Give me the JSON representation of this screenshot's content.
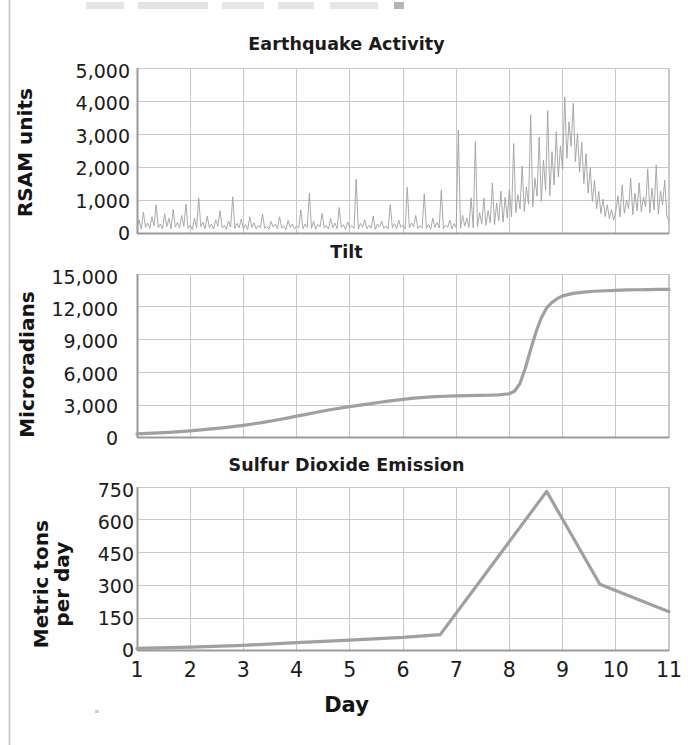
{
  "figure": {
    "x_axis_title": "Day",
    "x_ticks": [
      "1",
      "2",
      "3",
      "4",
      "5",
      "6",
      "7",
      "8",
      "9",
      "10",
      "11"
    ],
    "line_color": "#a0a0a0",
    "grid_color": "#c9c9c9",
    "axis_color": "#9a9a9a",
    "background": "#fefefe",
    "text_color": "#1b1b1b"
  },
  "charts": [
    {
      "id": "earthquake-activity",
      "title": "Earthquake Activity",
      "ylabel": "RSAM units",
      "ylabel_lines": "RSAM units",
      "yticks": [
        "5,000",
        "4,000",
        "3,000",
        "2,000",
        "1,000",
        "0"
      ],
      "ytick_values": [
        5000,
        4000,
        3000,
        2000,
        1000,
        0
      ]
    },
    {
      "id": "tilt",
      "title": "Tilt",
      "ylabel": "Microradians",
      "ylabel_lines": "Microradians",
      "yticks": [
        "15,000",
        "12,000",
        "9,000",
        "6,000",
        "3,000",
        "0"
      ],
      "ytick_values": [
        15000,
        12000,
        9000,
        6000,
        3000,
        0
      ]
    },
    {
      "id": "sulfur-dioxide-emission",
      "title": "Sulfur Dioxide Emission",
      "ylabel": "Metric tons per day",
      "ylabel_lines": "Metric tons\nper day",
      "yticks": [
        "750",
        "600",
        "450",
        "300",
        "150",
        "0"
      ],
      "ytick_values": [
        750,
        600,
        450,
        300,
        150,
        0
      ]
    }
  ],
  "chart_data": [
    {
      "type": "line",
      "id": "earthquake-activity",
      "title": "Earthquake Activity",
      "xlabel": "Day",
      "ylabel": "RSAM units",
      "xlim": [
        1,
        11
      ],
      "ylim": [
        0,
        5000
      ],
      "yticks": [
        0,
        1000,
        2000,
        3000,
        4000,
        5000
      ],
      "xticks": [
        1,
        2,
        3,
        4,
        5,
        6,
        7,
        8,
        9,
        10,
        11
      ],
      "grid": true,
      "legend": "none",
      "description": "Dense high-frequency seismic tremor trace. Background noise 100-900 RSAM with frequent spikes to 1,000-1,500 through days 1-7, escalating swarm days 7.5-9.5 with peaks to 3,000-4,100, then decay back to 300-2,000 noise through day 11.",
      "x": [
        1.0,
        1.04,
        1.08,
        1.12,
        1.16,
        1.2,
        1.24,
        1.28,
        1.32,
        1.36,
        1.4,
        1.44,
        1.48,
        1.52,
        1.56,
        1.6,
        1.64,
        1.68,
        1.72,
        1.76,
        1.8,
        1.84,
        1.88,
        1.92,
        1.96,
        2.0,
        2.04,
        2.08,
        2.12,
        2.16,
        2.2,
        2.24,
        2.28,
        2.32,
        2.36,
        2.4,
        2.44,
        2.48,
        2.52,
        2.56,
        2.6,
        2.64,
        2.68,
        2.72,
        2.76,
        2.8,
        2.84,
        2.88,
        2.92,
        2.96,
        3.0,
        3.04,
        3.08,
        3.12,
        3.16,
        3.2,
        3.24,
        3.28,
        3.32,
        3.36,
        3.4,
        3.44,
        3.48,
        3.52,
        3.56,
        3.6,
        3.64,
        3.68,
        3.72,
        3.76,
        3.8,
        3.84,
        3.88,
        3.92,
        3.96,
        4.0,
        4.04,
        4.08,
        4.12,
        4.16,
        4.2,
        4.24,
        4.28,
        4.32,
        4.36,
        4.4,
        4.44,
        4.48,
        4.52,
        4.56,
        4.6,
        4.64,
        4.68,
        4.72,
        4.76,
        4.8,
        4.84,
        4.88,
        4.92,
        4.96,
        5.0,
        5.04,
        5.08,
        5.12,
        5.16,
        5.2,
        5.24,
        5.28,
        5.32,
        5.36,
        5.4,
        5.44,
        5.48,
        5.52,
        5.56,
        5.6,
        5.64,
        5.68,
        5.72,
        5.76,
        5.8,
        5.84,
        5.88,
        5.92,
        5.96,
        6.0,
        6.04,
        6.08,
        6.12,
        6.16,
        6.2,
        6.24,
        6.28,
        6.32,
        6.36,
        6.4,
        6.44,
        6.48,
        6.52,
        6.56,
        6.6,
        6.64,
        6.68,
        6.72,
        6.76,
        6.8,
        6.84,
        6.88,
        6.92,
        6.96,
        7.0,
        7.04,
        7.08,
        7.12,
        7.16,
        7.2,
        7.24,
        7.28,
        7.32,
        7.36,
        7.4,
        7.44,
        7.48,
        7.52,
        7.56,
        7.6,
        7.64,
        7.68,
        7.72,
        7.76,
        7.8,
        7.84,
        7.88,
        7.92,
        7.96,
        8.0,
        8.04,
        8.08,
        8.12,
        8.16,
        8.2,
        8.24,
        8.28,
        8.32,
        8.36,
        8.4,
        8.44,
        8.48,
        8.52,
        8.56,
        8.6,
        8.64,
        8.68,
        8.72,
        8.76,
        8.8,
        8.84,
        8.88,
        8.92,
        8.96,
        9.0,
        9.04,
        9.08,
        9.12,
        9.16,
        9.2,
        9.24,
        9.28,
        9.32,
        9.36,
        9.4,
        9.44,
        9.48,
        9.52,
        9.56,
        9.6,
        9.64,
        9.68,
        9.72,
        9.76,
        9.8,
        9.84,
        9.88,
        9.92,
        9.96,
        10.0,
        10.04,
        10.08,
        10.12,
        10.16,
        10.2,
        10.24,
        10.28,
        10.32,
        10.36,
        10.4,
        10.44,
        10.48,
        10.52,
        10.56,
        10.6,
        10.64,
        10.68,
        10.72,
        10.76,
        10.8,
        10.84,
        10.88,
        10.92,
        10.96,
        11.0
      ],
      "y": [
        180,
        420,
        150,
        660,
        200,
        330,
        170,
        520,
        240,
        880,
        190,
        300,
        150,
        610,
        220,
        470,
        160,
        740,
        210,
        350,
        180,
        560,
        230,
        900,
        170,
        260,
        140,
        480,
        190,
        1080,
        220,
        360,
        160,
        540,
        200,
        300,
        150,
        430,
        230,
        700,
        180,
        260,
        140,
        390,
        210,
        1120,
        170,
        320,
        190,
        450,
        160,
        280,
        130,
        520,
        200,
        340,
        150,
        260,
        190,
        600,
        170,
        230,
        140,
        380,
        210,
        300,
        160,
        520,
        180,
        250,
        130,
        410,
        200,
        300,
        150,
        240,
        180,
        730,
        160,
        300,
        200,
        1230,
        170,
        380,
        140,
        290,
        210,
        620,
        180,
        260,
        150,
        470,
        190,
        330,
        160,
        800,
        200,
        280,
        140,
        360,
        190,
        250,
        170,
        1650,
        150,
        320,
        200,
        430,
        160,
        260,
        180,
        540,
        140,
        300,
        210,
        390,
        170,
        240,
        150,
        880,
        190,
        310,
        160,
        420,
        200,
        270,
        150,
        1410,
        180,
        330,
        210,
        560,
        160,
        250,
        190,
        1210,
        170,
        290,
        140,
        480,
        200,
        350,
        180,
        1320,
        160,
        270,
        200,
        420,
        150,
        310,
        190,
        3130,
        170,
        560,
        240,
        480,
        200,
        1090,
        180,
        2780,
        220,
        640,
        300,
        1080,
        260,
        700,
        340,
        1540,
        280,
        930,
        400,
        1290,
        360,
        1100,
        480,
        1350,
        520,
        2730,
        640,
        1190,
        760,
        2050,
        680,
        1420,
        900,
        3590,
        820,
        1680,
        1140,
        2920,
        980,
        2230,
        1320,
        3720,
        1160,
        2480,
        1480,
        3080,
        1720,
        2650,
        1960,
        4130,
        2280,
        3380,
        2640,
        3940,
        2180,
        3020,
        1860,
        2760,
        1520,
        2420,
        1240,
        1980,
        980,
        1620,
        760,
        1280,
        620,
        1050,
        520,
        880,
        460,
        740,
        420,
        680,
        1150,
        520,
        1480,
        620,
        1020,
        760,
        1680,
        580,
        1230,
        700,
        1540,
        660,
        1110,
        820,
        1960,
        640,
        1380,
        720,
        2080,
        600,
        1290,
        880,
        1620,
        540,
        380
      ]
    },
    {
      "type": "line",
      "id": "tilt",
      "title": "Tilt",
      "xlabel": "Day",
      "ylabel": "Microradians",
      "xlim": [
        1,
        11
      ],
      "ylim": [
        0,
        15000
      ],
      "yticks": [
        0,
        3000,
        6000,
        9000,
        12000,
        15000
      ],
      "xticks": [
        1,
        2,
        3,
        4,
        5,
        6,
        7,
        8,
        9,
        10,
        11
      ],
      "grid": true,
      "legend": "none",
      "description": "Smooth monotonic inflation curve. Slow creep from ~400 to ~3,900 microradians over days 1-7, brief plateau days 7-8.2, sharp inflation step to ~13,000 by day 9, then gentle approach to ~13,500 by day 11.",
      "x": [
        1.0,
        1.2,
        1.4,
        1.6,
        1.8,
        2.0,
        2.2,
        2.4,
        2.6,
        2.8,
        3.0,
        3.2,
        3.4,
        3.6,
        3.8,
        4.0,
        4.2,
        4.4,
        4.6,
        4.8,
        5.0,
        5.2,
        5.4,
        5.6,
        5.8,
        6.0,
        6.2,
        6.4,
        6.6,
        6.8,
        7.0,
        7.2,
        7.4,
        7.6,
        7.8,
        8.0,
        8.1,
        8.2,
        8.3,
        8.4,
        8.5,
        8.6,
        8.7,
        8.8,
        8.9,
        9.0,
        9.2,
        9.4,
        9.6,
        9.8,
        10.0,
        10.2,
        10.4,
        10.6,
        10.8,
        11.0
      ],
      "y": [
        380,
        420,
        470,
        520,
        590,
        660,
        740,
        830,
        930,
        1040,
        1160,
        1300,
        1450,
        1620,
        1800,
        2000,
        2190,
        2380,
        2560,
        2720,
        2870,
        3010,
        3150,
        3290,
        3420,
        3540,
        3640,
        3720,
        3780,
        3820,
        3850,
        3870,
        3890,
        3910,
        3950,
        4050,
        4300,
        5000,
        6400,
        8100,
        9700,
        11000,
        11900,
        12400,
        12750,
        13000,
        13230,
        13350,
        13420,
        13470,
        13510,
        13540,
        13560,
        13575,
        13585,
        13590
      ]
    },
    {
      "type": "line",
      "id": "sulfur-dioxide-emission",
      "title": "Sulfur Dioxide Emission",
      "xlabel": "Day",
      "ylabel": "Metric tons per day",
      "xlim": [
        1,
        11
      ],
      "ylim": [
        0,
        750
      ],
      "yticks": [
        0,
        150,
        300,
        450,
        600,
        750
      ],
      "xticks": [
        1,
        2,
        3,
        4,
        5,
        6,
        7,
        8,
        9,
        10,
        11
      ],
      "grid": true,
      "legend": "none",
      "description": "Low baseline SO2 emission near 10-75 metric tons/day from day 1 to 6.7, then a steep linear climb to a peak of ~730 metric tons/day at day 8.7, followed by a rapid fall to ~305 at day 9.7 and a slow decline to ~180 by day 11.",
      "x": [
        1.0,
        2.0,
        3.0,
        4.0,
        5.0,
        6.0,
        6.7,
        8.7,
        9.7,
        11.0
      ],
      "y": [
        12,
        18,
        26,
        38,
        50,
        62,
        75,
        730,
        305,
        180
      ]
    }
  ]
}
